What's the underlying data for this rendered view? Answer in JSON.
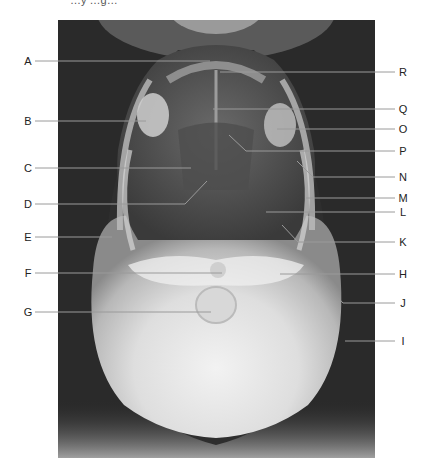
{
  "figure": {
    "caption_fragment": "…y …g…",
    "type": "radiograph",
    "view": "submentovertical skull x-ray",
    "frame": {
      "x": 58,
      "y": 20,
      "width": 317,
      "height": 438
    }
  },
  "labels": {
    "left": [
      {
        "letter": "A",
        "y": 61,
        "end_x": 210
      },
      {
        "letter": "B",
        "y": 121,
        "end_x": 146
      },
      {
        "letter": "C",
        "y": 168,
        "end_x": 191
      },
      {
        "letter": "D",
        "y": 204,
        "end_x": 185,
        "bend_to": [
          207,
          181
        ]
      },
      {
        "letter": "E",
        "y": 237,
        "end_x": 112
      },
      {
        "letter": "F",
        "y": 273,
        "end_x": 222
      },
      {
        "letter": "G",
        "y": 312,
        "end_x": 211
      }
    ],
    "right": [
      {
        "letter": "R",
        "y": 72,
        "end_x": 220
      },
      {
        "letter": "Q",
        "y": 109,
        "end_x": 213
      },
      {
        "letter": "O",
        "y": 129,
        "end_x": 277
      },
      {
        "letter": "P",
        "y": 151,
        "end_x": 246,
        "bend_to": [
          229,
          135
        ]
      },
      {
        "letter": "N",
        "y": 177,
        "end_x": 313,
        "bend_to": [
          297,
          161
        ]
      },
      {
        "letter": "M",
        "y": 198,
        "end_x": 306
      },
      {
        "letter": "L",
        "y": 212,
        "end_x": 266
      },
      {
        "letter": "K",
        "y": 242,
        "end_x": 298,
        "bend_to": [
          282,
          225
        ]
      },
      {
        "letter": "H",
        "y": 274,
        "end_x": 280
      },
      {
        "letter": "J",
        "y": 303,
        "end_x": 343,
        "bend_to": [
          327,
          286
        ]
      },
      {
        "letter": "I",
        "y": 341,
        "end_x": 345
      }
    ]
  },
  "colors": {
    "background": "#ffffff",
    "film_dark": "#2a2a2a",
    "bone_light": "#e8e8e8",
    "leader_line": "#9a9a9a",
    "label_text": "#222222"
  }
}
